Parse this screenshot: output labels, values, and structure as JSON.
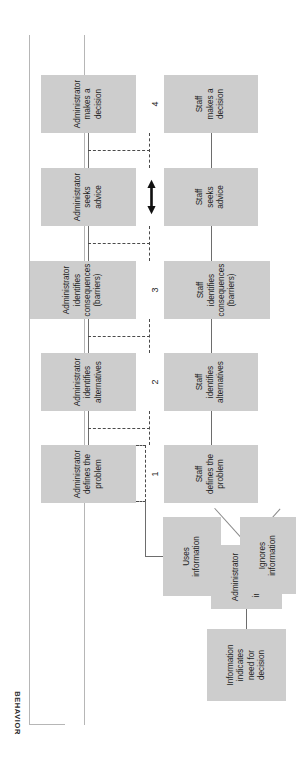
{
  "figure": {
    "type": "flowchart",
    "orientation": "rotated-90-ccw",
    "box_fill": "#cdcdcd",
    "line_color": "#6d6d6d",
    "axes": {
      "behavior_label": "BEHAVIOR",
      "time_label": "TIME"
    }
  },
  "nodes": {
    "information_need": {
      "id": "information-indicates-need",
      "lines": [
        "Information",
        "indicates",
        "need for",
        "decision"
      ]
    },
    "admin_receives": {
      "id": "administrator-receives-information",
      "lines": [
        "Administrator",
        "receives",
        "information"
      ]
    },
    "uses_information": {
      "id": "uses-information",
      "lines": [
        "Uses",
        "information"
      ]
    },
    "ignores_information": {
      "id": "ignores-information",
      "lines": [
        "Ignores",
        "information"
      ]
    }
  },
  "stages": [
    {
      "number": "1",
      "admin": {
        "lines": [
          "Administrator",
          "defines the",
          "problem"
        ]
      },
      "staff": {
        "lines": [
          "Staff",
          "defines the",
          "problem"
        ]
      }
    },
    {
      "number": "2",
      "admin": {
        "lines": [
          "Administrator",
          "identifies",
          "alternatives"
        ]
      },
      "staff": {
        "lines": [
          "Staff",
          "identifies",
          "alternatives"
        ]
      }
    },
    {
      "number": "3",
      "admin": {
        "lines": [
          "Administrator",
          "identifies",
          "consequences",
          "(barriers)"
        ]
      },
      "staff": {
        "lines": [
          "Staff",
          "identifies",
          "consequences",
          "(barriers)"
        ]
      }
    },
    {
      "number": "",
      "admin": {
        "lines": [
          "Administrator",
          "seeks",
          "advice"
        ]
      },
      "staff": {
        "lines": [
          "Staff",
          "seeks",
          "advice"
        ]
      }
    },
    {
      "number": "4",
      "admin": {
        "lines": [
          "Administrator",
          "makes a",
          "decision"
        ]
      },
      "staff": {
        "lines": [
          "Staff",
          "makes a",
          "decision"
        ]
      }
    }
  ]
}
